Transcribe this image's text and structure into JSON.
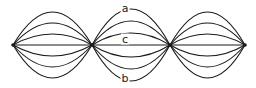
{
  "figure": {
    "background_color": "#ffffff",
    "stroke_color": "#1a1a1a",
    "width": 256,
    "height": 88
  },
  "graph": {
    "vertex_count": 4,
    "vertices": [
      {
        "id": "v1",
        "x": 13,
        "y": 45
      },
      {
        "id": "v2",
        "x": 92,
        "y": 45
      },
      {
        "id": "v3",
        "x": 170,
        "y": 45
      },
      {
        "id": "v4",
        "x": 245,
        "y": 45
      }
    ],
    "bundles": [
      {
        "id": "bundle-left",
        "from": "v1",
        "to": "v2",
        "edge_count": 7,
        "offsets": [
          -33,
          -22,
          -11,
          0,
          11,
          22,
          33
        ]
      },
      {
        "id": "bundle-middle",
        "from": "v2",
        "to": "v3",
        "edge_count": 7,
        "offsets": [
          -36,
          -24,
          -12,
          0,
          12,
          24,
          36
        ]
      },
      {
        "id": "bundle-right",
        "from": "v3",
        "to": "v4",
        "edge_count": 7,
        "offsets": [
          -33,
          -22,
          -11,
          0,
          11,
          22,
          33
        ]
      }
    ]
  },
  "labels": {
    "top": {
      "text": "a",
      "x": 125,
      "y": 8
    },
    "middle": {
      "text": "c",
      "x": 125,
      "y": 39
    },
    "bottom": {
      "text": "b",
      "x": 125,
      "y": 78
    }
  }
}
